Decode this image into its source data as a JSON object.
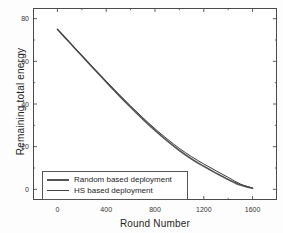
{
  "chart_data": {
    "type": "line",
    "title": "",
    "xlabel": "Round Number",
    "ylabel": "Remaining total energy",
    "xlim": [
      -200,
      1800
    ],
    "ylim": [
      -5,
      85
    ],
    "xticks": [
      0,
      400,
      800,
      1200,
      1600
    ],
    "yticks": [
      0,
      20,
      40,
      60,
      80
    ],
    "xtick_labels": [
      "0",
      "400",
      "800",
      "1200",
      "1600"
    ],
    "ytick_labels": [
      "0",
      "20",
      "40",
      "60",
      "80"
    ],
    "grid": false,
    "legend_position": "lower left inside",
    "minor_ticks": true,
    "x": [
      0,
      100,
      200,
      300,
      400,
      500,
      600,
      700,
      800,
      900,
      1000,
      1100,
      1200,
      1300,
      1400,
      1500,
      1600
    ],
    "series": [
      {
        "name": "Random based deployment",
        "color": "#555555",
        "linewidth": 1.6,
        "values": [
          75.0,
          68.8,
          62.6,
          56.4,
          50.3,
          44.3,
          38.5,
          32.9,
          27.6,
          22.7,
          18.2,
          14.2,
          10.8,
          7.6,
          4.6,
          2.0,
          0.5
        ]
      },
      {
        "name": "HS based deployment",
        "color": "#3a3a3a",
        "linewidth": 1.0,
        "values": [
          75.0,
          68.9,
          62.8,
          56.7,
          50.7,
          44.8,
          39.1,
          33.6,
          28.4,
          23.6,
          19.2,
          15.3,
          11.9,
          8.7,
          5.6,
          2.5,
          0.6
        ]
      }
    ],
    "legend_entries": [
      {
        "label": "Random based deployment",
        "swatch": "thick-line"
      },
      {
        "label": "HS based deployment",
        "swatch": "thin-line"
      }
    ]
  },
  "figure": {
    "frame_color": "#4a4a4a",
    "background": "#ffffff"
  }
}
